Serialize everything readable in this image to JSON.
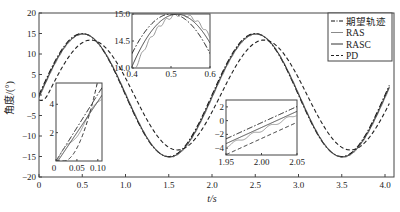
{
  "chart_data": {
    "type": "line",
    "title": "",
    "xlabel": "t/s",
    "ylabel": "角度/(°)",
    "xlim": [
      0,
      4.0
    ],
    "ylim": [
      -20,
      20
    ],
    "xticks": [
      "0",
      "0.5",
      "1.0",
      "1.5",
      "2.0",
      "2.5",
      "3.0",
      "3.5",
      "4.0"
    ],
    "yticks": [
      "20",
      "15",
      "10",
      "5",
      "0",
      "-5",
      "-10",
      "-15",
      "-20"
    ],
    "grid": false,
    "legend_position": "upper right",
    "legend": [
      "期望轨迹",
      "RAS",
      "RASC",
      "PD"
    ],
    "series": [
      {
        "name": "期望轨迹",
        "style": "dash-dot",
        "description": "15·sin(πt), amplitude 15°, period 2 s",
        "x": [
          0,
          0.25,
          0.5,
          0.75,
          1.0,
          1.25,
          1.5,
          1.75,
          2.0,
          2.25,
          2.5,
          2.75,
          3.0,
          3.25,
          3.5,
          3.75,
          4.0
        ],
        "y": [
          0,
          10.6,
          15,
          10.6,
          0,
          -10.6,
          -15,
          -10.6,
          0,
          10.6,
          15,
          10.6,
          0,
          -10.6,
          -15,
          -10.6,
          0
        ]
      },
      {
        "name": "RAS",
        "style": "solid-light",
        "description": "tracks desired closely with small jitter, slight lag",
        "x": [
          0,
          0.25,
          0.5,
          0.75,
          1.0,
          1.25,
          1.5,
          1.75,
          2.0,
          2.25,
          2.5,
          2.75,
          3.0,
          3.25,
          3.5,
          3.75,
          4.0
        ],
        "y": [
          -0.3,
          10.2,
          14.9,
          10.9,
          0.4,
          -10.3,
          -14.9,
          -10.9,
          -0.5,
          10.2,
          14.9,
          10.9,
          0.4,
          -10.3,
          -14.9,
          -10.9,
          -0.3
        ]
      },
      {
        "name": "RASC",
        "style": "solid",
        "description": "nearly overlaps desired trajectory",
        "x": [
          0,
          0.25,
          0.5,
          0.75,
          1.0,
          1.25,
          1.5,
          1.75,
          2.0,
          2.25,
          2.5,
          2.75,
          3.0,
          3.25,
          3.5,
          3.75,
          4.0
        ],
        "y": [
          -0.2,
          10.4,
          15,
          10.7,
          0.2,
          -10.5,
          -15,
          -10.7,
          -0.3,
          10.4,
          15,
          10.7,
          0.2,
          -10.5,
          -15,
          -10.7,
          -0.2
        ]
      },
      {
        "name": "PD",
        "style": "dashed",
        "description": "reduced amplitude (~13.5°) with phase lag",
        "x": [
          0,
          0.25,
          0.5,
          0.75,
          1.0,
          1.25,
          1.5,
          1.75,
          2.0,
          2.25,
          2.5,
          2.75,
          3.0,
          3.25,
          3.5,
          3.75,
          4.0
        ],
        "y": [
          -1.2,
          8.3,
          12.9,
          12.0,
          2.2,
          -8.4,
          -13.1,
          -12.5,
          -2.6,
          8.3,
          13.0,
          12.4,
          2.4,
          -8.4,
          -13.2,
          -12.5,
          -2.5
        ]
      }
    ],
    "insets": [
      {
        "name": "zoom-peak",
        "xlim": [
          0.4,
          0.6
        ],
        "ylim": [
          14.0,
          15.0
        ],
        "xticks": [
          "0.4",
          "0.5",
          "0.6"
        ],
        "yticks": [
          "15.0",
          "14.5",
          "14.0"
        ]
      },
      {
        "name": "zoom-start",
        "xlim": [
          0,
          0.11
        ],
        "ylim": [
          0,
          5.5
        ],
        "xticks": [
          "0",
          "0.05",
          "0.10"
        ],
        "yticks": [
          "4",
          "2"
        ]
      },
      {
        "name": "zoom-crossing",
        "xlim": [
          1.95,
          2.05
        ],
        "ylim": [
          -5,
          3
        ],
        "xticks": [
          "1.95",
          "2.00",
          "2.05"
        ],
        "yticks": [
          "2",
          "0",
          "-2",
          "-4"
        ]
      }
    ]
  },
  "colors": {
    "desired": "#111111",
    "ras": "#8a8a8a",
    "rasc": "#333333",
    "pd": "#222222",
    "axis": "#444444"
  }
}
